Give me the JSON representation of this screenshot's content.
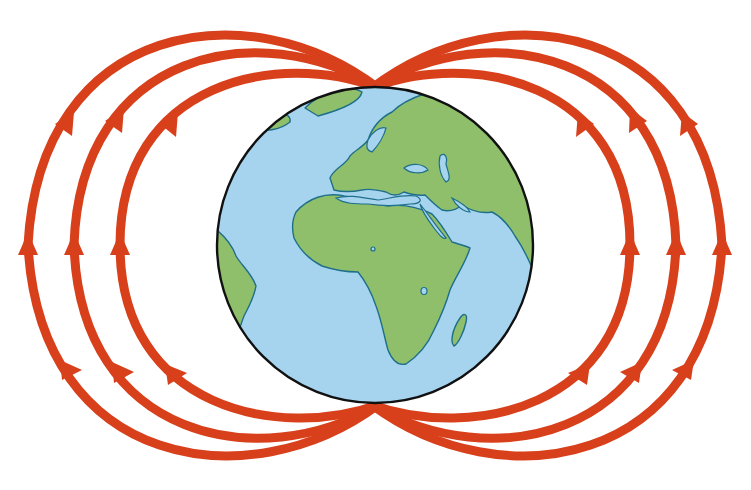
{
  "diagram": {
    "colors": {
      "background": "#ffffff",
      "field_line": "#d8401c",
      "ocean": "#a6d4ef",
      "land": "#8fbf6a",
      "coastline": "#1f6f8b",
      "globe_outline": "#111111"
    },
    "globe": {
      "cx": 375,
      "cy": 245,
      "r": 158,
      "label": "Earth (Europe/Africa view)"
    },
    "field_lines": {
      "count_per_side": 3,
      "sides": [
        "left",
        "right"
      ],
      "arrow_direction": "south-to-north (upward)",
      "arrows_per_line": 3
    }
  }
}
